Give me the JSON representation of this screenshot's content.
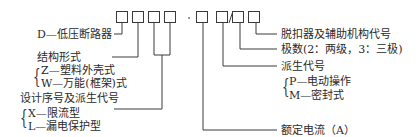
{
  "model_code": {
    "boxes": 8,
    "separators": {
      "dash": "-",
      "slash": "/"
    }
  },
  "labels_left": {
    "d": "D—低压断路器",
    "structure_title": "结构形式",
    "structure_z": "Z—塑料外壳式",
    "structure_w": "W—万能(框架)式",
    "design_title": "设计序号及派生代号",
    "design_x": "X—限流型",
    "design_l": "L—漏电保护型"
  },
  "labels_right": {
    "release": "脱扣器及辅助机构代号",
    "poles": "极数(2：两级，3：三极)",
    "derived_title": "派生代号",
    "derived_p": "P—电动操作",
    "derived_m": "M—密封式",
    "rated_current": "额定电流（A）"
  },
  "colors": {
    "line": "#3a3a3a",
    "text": "#2a2a2a"
  }
}
